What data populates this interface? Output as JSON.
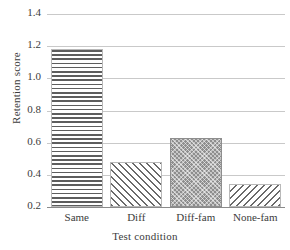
{
  "chart_data": {
    "type": "bar",
    "title": "",
    "xlabel": "Test condition",
    "ylabel": "Retention score",
    "categories": [
      "Same",
      "Diff",
      "Diff-fam",
      "None-fam"
    ],
    "values": [
      1.18,
      0.48,
      0.63,
      0.34
    ],
    "series": [
      {
        "name": "Retention score",
        "values": [
          1.18,
          0.48,
          0.63,
          0.34
        ]
      }
    ],
    "ylim": [
      0.2,
      1.4
    ],
    "xlim": null,
    "yticks": [
      "1.4",
      "1.2",
      "1.0",
      "0.8",
      "0.6",
      "0.4",
      "0.2"
    ],
    "ytick_values": [
      1.4,
      1.2,
      1.0,
      0.8,
      0.6,
      0.4,
      0.2
    ],
    "grid": true,
    "grid_axis": "y",
    "legend": null,
    "legend_position": "none",
    "annotations": [],
    "bar_patterns": [
      "horizontal-lines",
      "forward-diagonal-hatch",
      "dense-dotted-gray-fill",
      "back-diagonal-hatch"
    ],
    "colors": {
      "background": "#ffffff",
      "gridline": "#c9c9c9",
      "axis": "#8a8a8a",
      "text": "#3c3c3c",
      "hatch": "#5d5d5d",
      "solid_fill": "#8e8e8e"
    }
  }
}
